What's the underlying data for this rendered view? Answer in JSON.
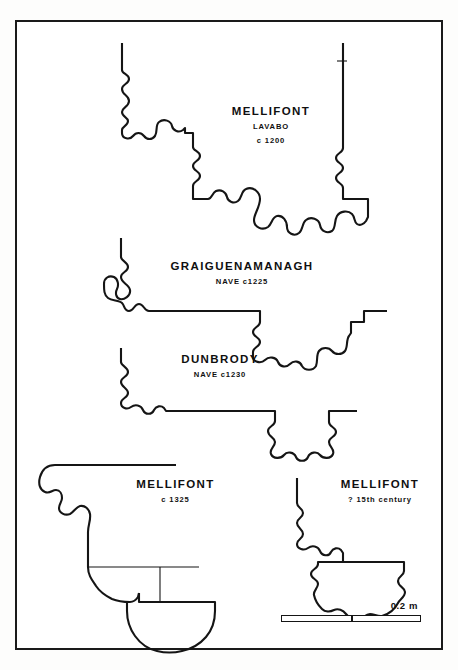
{
  "figure": {
    "kind": "archaeological-line-drawing",
    "background_color": "#ffffff",
    "ink_color": "#151515",
    "frame": {
      "border_color": "#1a1a1a",
      "border_width_px": 2
    }
  },
  "profiles": [
    {
      "id": "mellifont-lavabo",
      "title": "MELLIFONT",
      "sub1": "LAVABO",
      "sub2": "c 1200"
    },
    {
      "id": "graiguenamanagh",
      "title": "GRAIGUENAMANAGH",
      "sub1": "NAVE  c1225",
      "sub2": ""
    },
    {
      "id": "dunbrody",
      "title": "DUNBRODY",
      "sub1": "NAVE  c1230",
      "sub2": ""
    },
    {
      "id": "mellifont-1325",
      "title": "MELLIFONT",
      "sub1": "c 1325",
      "sub2": ""
    },
    {
      "id": "mellifont-15c",
      "title": "MELLIFONT",
      "sub1": "? 15th century",
      "sub2": ""
    }
  ],
  "scale": {
    "label": "0.2 m",
    "divisions": 2,
    "bar_length_px": 140
  }
}
